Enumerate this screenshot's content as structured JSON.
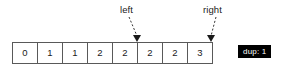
{
  "array": {
    "name": "array-cells",
    "values": [
      "0",
      "1",
      "1",
      "2",
      "2",
      "2",
      "2",
      "3"
    ]
  },
  "pointers": [
    {
      "label": "left",
      "target_index": 4
    },
    {
      "label": "right",
      "target_index": 7
    }
  ],
  "badge": {
    "text": "dup: 1",
    "background": "#000000",
    "color": "#ffffff"
  },
  "colors": {
    "cell_border": "#595959",
    "text": "#1a1a1a",
    "arrow": "#333333",
    "background": "#ffffff"
  }
}
